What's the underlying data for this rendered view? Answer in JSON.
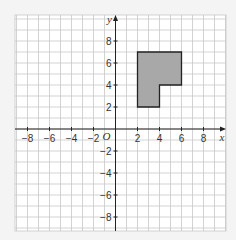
{
  "diagram": {
    "axes": {
      "x_label": "x",
      "y_label": "y",
      "origin_label": "O",
      "x_ticks": [
        -8,
        -6,
        -4,
        -2,
        2,
        4,
        6,
        8
      ],
      "y_ticks": [
        8,
        6,
        4,
        2,
        -2,
        -4,
        -6,
        -8
      ],
      "x_tick_labels": [
        "−8",
        "−6",
        "−4",
        "−2",
        "2",
        "4",
        "6",
        "8"
      ],
      "y_tick_labels": [
        "8",
        "6",
        "4",
        "2",
        "−2",
        "−4",
        "−6",
        "−8"
      ]
    },
    "shape": {
      "vertices": [
        [
          2,
          2
        ],
        [
          2,
          7
        ],
        [
          6,
          7
        ],
        [
          6,
          4
        ],
        [
          4,
          4
        ],
        [
          4,
          2
        ]
      ],
      "fill": "#a8a8a8",
      "stroke": "#222222"
    },
    "colors": {
      "background": "#f4f4f4",
      "grid_bg": "#ffffff",
      "grid_line": "#c8c8c8",
      "axis": "#222222"
    }
  }
}
